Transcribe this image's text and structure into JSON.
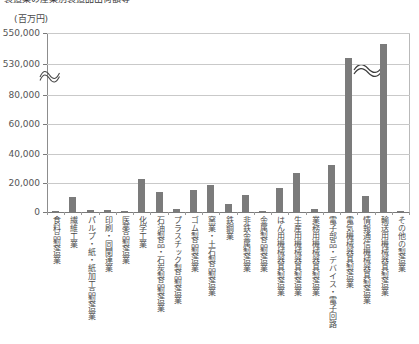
{
  "header": {
    "cropped_title": "製造業の産業別製造品出荷額等",
    "unit_label": "(百万円)"
  },
  "axis": {
    "y_ticks": [
      "550,000",
      "530,000",
      "80,000",
      "60,000",
      "40,000",
      "20,000",
      "0"
    ],
    "break_marker": "≈"
  },
  "chart_data": {
    "type": "bar",
    "title": "",
    "xlabel": "",
    "ylabel": "",
    "unit": "百万円",
    "grid": true,
    "legend": "none",
    "axis_break": {
      "lower_max": 80000,
      "upper_min": 530000
    },
    "ylim": [
      0,
      550000
    ],
    "ytick_values": [
      0,
      20000,
      40000,
      60000,
      80000,
      530000,
      550000
    ],
    "categories": [
      "食料品製造業",
      "繊維工業",
      "パルプ・紙・紙加工品製造業",
      "印刷・同関連業",
      "医薬品製造業",
      "化学工業",
      "石油製品・石炭製品製造業",
      "プラスチック製品製造業",
      "ゴム製品製造業",
      "窯業・土石製品製造業",
      "鉄鋼業",
      "非鉄金属製造業",
      "金属製品製造業",
      "はん用機械器具製造業",
      "生産用機械器具製造業",
      "業務用機械器具製造業",
      "電子部品・デバイス・電子回路",
      "電気機械器具製造業",
      "情報通信機械器具製造業",
      "輸送用機械器具製造業",
      "その他の製造業"
    ],
    "values": [
      900,
      10300,
      1400,
      1500,
      500,
      22800,
      13400,
      2000,
      15100,
      18600,
      5400,
      11400,
      900,
      16300,
      26700,
      2200,
      31900,
      534000,
      11200,
      543000,
      700
    ]
  }
}
